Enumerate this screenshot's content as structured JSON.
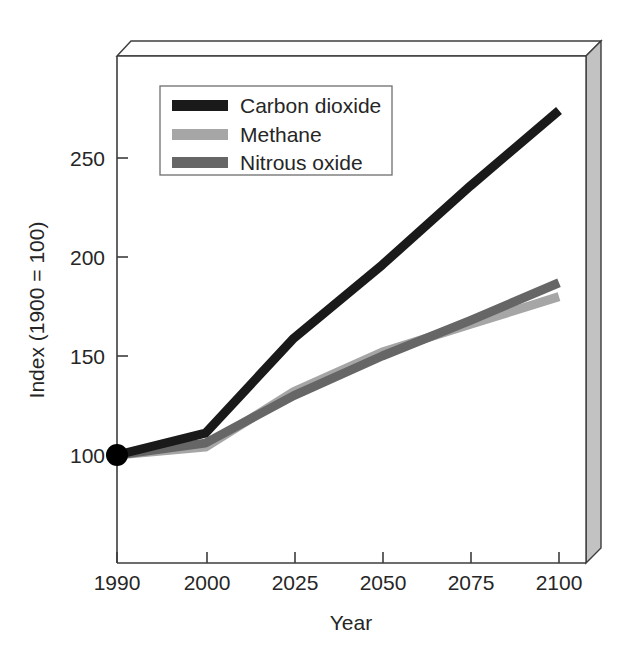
{
  "chart_data": {
    "type": "line",
    "title": "",
    "xlabel": "Year",
    "ylabel": "Index (1900 = 100)",
    "categories": [
      "1990",
      "2000",
      "2025",
      "2050",
      "2075",
      "2100"
    ],
    "xtick_labels": [
      "1990",
      "2000",
      "2025",
      "2050",
      "2075",
      "2100"
    ],
    "ytick_labels": [
      "100",
      "150",
      "200",
      "250"
    ],
    "ytick_values": [
      100,
      150,
      200,
      250
    ],
    "ylim": [
      60,
      285
    ],
    "grid": false,
    "legend_position": "upper-left-inside",
    "series": [
      {
        "name": "Carbon dioxide",
        "color": "#1a1a1a",
        "values": [
          100,
          111,
          159,
          196,
          236,
          274
        ]
      },
      {
        "name": "Methane",
        "color": "#a6a6a6",
        "values": [
          100,
          104,
          132,
          152,
          166,
          180
        ]
      },
      {
        "name": "Nitrous oxide",
        "color": "#666666",
        "values": [
          100,
          106,
          130,
          150,
          168,
          187
        ]
      }
    ],
    "markers": [
      {
        "series": "Carbon dioxide",
        "x": "1990",
        "y": 100,
        "shape": "filled-circle",
        "color": "#000000"
      }
    ],
    "annotations": []
  },
  "legend": {
    "entries": [
      {
        "label": "Carbon dioxide",
        "color": "#1a1a1a"
      },
      {
        "label": "Methane",
        "color": "#a6a6a6"
      },
      {
        "label": "Nitrous oxide",
        "color": "#666666"
      }
    ]
  },
  "axes": {
    "y_title": "Index (1900 = 100)",
    "x_title": "Year",
    "y_ticks": [
      "250",
      "200",
      "150",
      "100"
    ],
    "x_ticks": [
      "1990",
      "2000",
      "2025",
      "2050",
      "2075",
      "2100"
    ]
  },
  "style": {
    "plot_background": "#ffffff",
    "frame_line": "#3d3d3d",
    "panel_face": "#c0c0c0",
    "panel_top": "#fbfbfb",
    "text_color": "#262626"
  }
}
